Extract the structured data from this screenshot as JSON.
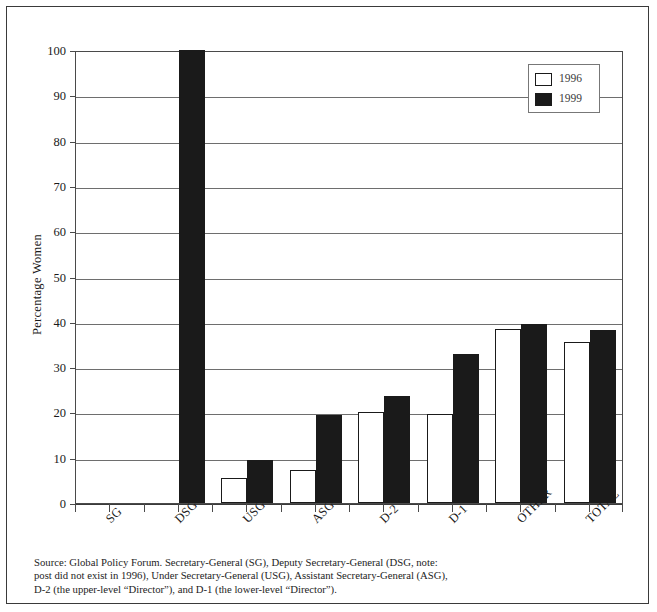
{
  "chart_data": {
    "type": "bar",
    "title": "",
    "xlabel": "",
    "ylabel": "Percentage Women",
    "ylim": [
      0,
      100
    ],
    "ytick_step": 10,
    "yticks": [
      0,
      10,
      20,
      30,
      40,
      50,
      60,
      70,
      80,
      90,
      100
    ],
    "grid": true,
    "legend_position": "top-right",
    "categories": [
      "SG",
      "DSG",
      "USG",
      "ASG",
      "D-2",
      "D-1",
      "OTHER",
      "TOTAL"
    ],
    "series": [
      {
        "name": "1996",
        "color": "#ffffff",
        "values": [
          0,
          null,
          5.5,
          7.2,
          20.2,
          19.6,
          38.4,
          35.5
        ]
      },
      {
        "name": "1999",
        "color": "#1a1a1a",
        "values": [
          0,
          100,
          9.4,
          19.5,
          23.6,
          33.0,
          39.5,
          38.3
        ]
      }
    ]
  },
  "legend": {
    "entries": [
      {
        "label": "1996"
      },
      {
        "label": "1999"
      }
    ]
  },
  "axis": {
    "y_title": "Percentage Women",
    "y_tick_labels": [
      "100",
      "90",
      "80",
      "70",
      "60",
      "50",
      "40",
      "30",
      "20",
      "10",
      "0"
    ],
    "x_tick_labels": [
      "SG",
      "DSG",
      "USG",
      "ASG",
      "D-2",
      "D-1",
      "OTHER",
      "TOTAL"
    ]
  },
  "source_note": {
    "line1": "Source: Global Policy Forum. Secretary-General (SG), Deputy Secretary-General (DSG, note:",
    "line2": "post did not exist in 1996), Under Secretary-General (USG), Assistant Secretary-General (ASG),",
    "line3": "D-2 (the upper-level “Director”), and D-1 (the lower-level “Director”)."
  },
  "colors": {
    "frame": "#3a3a3a",
    "gridline": "#6e6e6e",
    "bar_1996": "#ffffff",
    "bar_1999": "#1a1a1a",
    "background": "#ffffff"
  }
}
